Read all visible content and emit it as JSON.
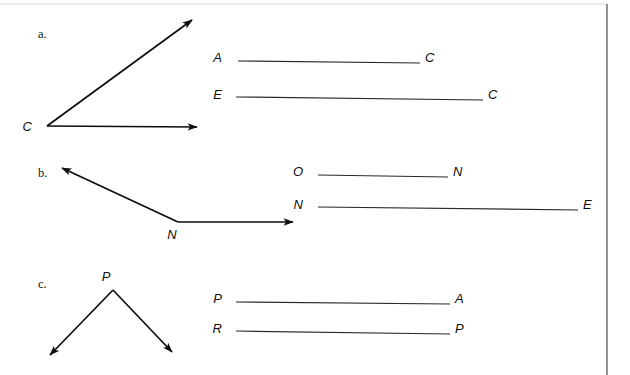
{
  "page": {
    "background_color": "#ffffff",
    "ink_color": "#0d0d0d",
    "width": 630,
    "height": 375
  },
  "items": [
    {
      "id": "a",
      "letter": "a.",
      "letter_x": 38,
      "letter_y": 38,
      "angle": {
        "vertex_label": "C",
        "vertex_label_x": 32,
        "vertex_label_y": 131,
        "vertex_x": 47,
        "vertex_y": 126,
        "rays": [
          {
            "name": "upper-right-ray",
            "to_x": 192,
            "to_y": 20
          },
          {
            "name": "horizontal-right-ray",
            "to_x": 197,
            "to_y": 127
          }
        ]
      },
      "segments": [
        {
          "name": "segment-a-c",
          "left_label": "A",
          "right_label": "C",
          "left_label_x": 222,
          "right_label_x": 425,
          "y": 62,
          "line_x1": 238,
          "line_x2": 420,
          "line_y1": 61,
          "line_y2": 63
        },
        {
          "name": "segment-e-c",
          "left_label": "E",
          "right_label": "C",
          "left_label_x": 222,
          "right_label_x": 488,
          "y": 99,
          "line_x1": 236,
          "line_x2": 483,
          "line_y1": 97,
          "line_y2": 100
        }
      ]
    },
    {
      "id": "b",
      "letter": "b.",
      "letter_x": 38,
      "letter_y": 177,
      "angle": {
        "vertex_label": "N",
        "vertex_label_x": 172,
        "vertex_label_y": 239,
        "vertex_x": 178,
        "vertex_y": 222,
        "rays": [
          {
            "name": "upper-left-ray",
            "to_x": 62,
            "to_y": 168
          },
          {
            "name": "horizontal-right-ray",
            "to_x": 293,
            "to_y": 222
          }
        ]
      },
      "segments": [
        {
          "name": "segment-o-n",
          "left_label": "O",
          "right_label": "N",
          "left_label_x": 303,
          "right_label_x": 453,
          "y": 176,
          "line_x1": 318,
          "line_x2": 448,
          "line_y1": 175,
          "line_y2": 177
        },
        {
          "name": "segment-n-e",
          "left_label": "N",
          "right_label": "E",
          "left_label_x": 303,
          "right_label_x": 583,
          "y": 209,
          "line_x1": 318,
          "line_x2": 578,
          "line_y1": 207,
          "line_y2": 210
        }
      ]
    },
    {
      "id": "c",
      "letter": "c.",
      "letter_x": 38,
      "letter_y": 288,
      "angle": {
        "vertex_label": "P",
        "vertex_label_x": 106,
        "vertex_label_y": 281,
        "vertex_x": 113,
        "vertex_y": 290,
        "rays": [
          {
            "name": "lower-left-ray",
            "to_x": 50,
            "to_y": 355
          },
          {
            "name": "lower-right-ray",
            "to_x": 172,
            "to_y": 352
          }
        ]
      },
      "segments": [
        {
          "name": "segment-p-a",
          "left_label": "P",
          "right_label": "A",
          "left_label_x": 222,
          "right_label_x": 455,
          "y": 303,
          "line_x1": 236,
          "line_x2": 450,
          "line_y1": 302,
          "line_y2": 304
        },
        {
          "name": "segment-r-p",
          "left_label": "R",
          "right_label": "P",
          "left_label_x": 222,
          "right_label_x": 455,
          "y": 333,
          "line_x1": 236,
          "line_x2": 450,
          "line_y1": 331,
          "line_y2": 334
        }
      ]
    }
  ],
  "frame": {
    "right_rule_x": 607,
    "right_rule_y1": 4,
    "right_rule_y2": 375,
    "top_ghost_y": 4,
    "top_ghost_x1": 0,
    "top_ghost_x2": 607
  }
}
